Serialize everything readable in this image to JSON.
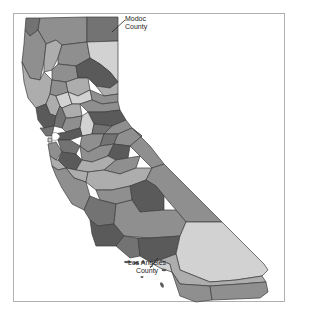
{
  "map": {
    "type": "choropleth",
    "region": "California counties",
    "labels": [
      {
        "id": "modoc",
        "line1": "Modoc",
        "line2": "County"
      },
      {
        "id": "la",
        "line1": "Los Angeles",
        "line2": "County"
      }
    ],
    "shades": {
      "darkest": "#5a5a5a",
      "dark": "#737373",
      "mid": "#8f8f8f",
      "light": "#adadad",
      "lightest": "#d2d2d2",
      "border": "#3c3c3c",
      "frame": "#b0b0b0"
    }
  }
}
